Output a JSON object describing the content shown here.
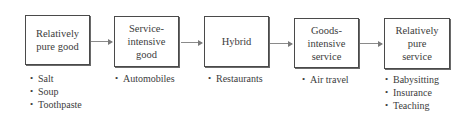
{
  "diagram": {
    "stages": [
      {
        "label": "Relatively\npure good",
        "examples": [
          "Salt",
          "Soup",
          "Toothpaste"
        ]
      },
      {
        "label": "Service-\nintensive\ngood",
        "examples": [
          "Automobiles"
        ]
      },
      {
        "label": "Hybrid",
        "examples": [
          "Restaurants"
        ]
      },
      {
        "label": "Goods-\nintensive\nservice",
        "examples": [
          "Air travel"
        ]
      },
      {
        "label": "Relatively\npure\nservice",
        "examples": [
          "Babysitting",
          "Insurance",
          "Teaching"
        ]
      }
    ],
    "colors": {
      "border": "#4a4a4a",
      "text": "#3c3c3c",
      "arrow": "#8a8a8a",
      "background": "#ffffff"
    }
  }
}
